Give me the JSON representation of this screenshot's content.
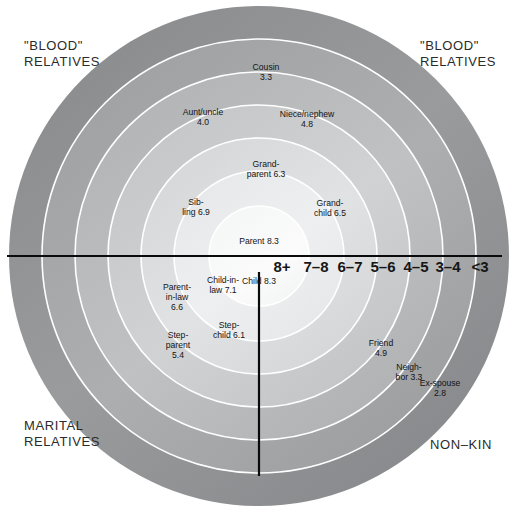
{
  "figure": {
    "type": "concentric-rings",
    "center": {
      "x": 259,
      "y": 256
    },
    "outer_radius": 250
  },
  "quadrant_labels": {
    "top_left": "\"BLOOD\"\nRELATIVES",
    "top_right": "\"BLOOD\"\nRELATIVES",
    "bottom_left": "MARITAL\nRELATIVES",
    "bottom_right": "NON–KIN"
  },
  "scale": {
    "axis_name": "closeness-scale",
    "ticks": [
      {
        "label": "8+",
        "x": 282,
        "y": 266,
        "emphasis": "big"
      },
      {
        "label": "7–8",
        "x": 316,
        "y": 266,
        "emphasis": "big"
      },
      {
        "label": "6–7",
        "x": 350,
        "y": 266,
        "emphasis": "big"
      },
      {
        "label": "5–6",
        "x": 383,
        "y": 266,
        "emphasis": "big"
      },
      {
        "label": "4–5",
        "x": 416,
        "y": 266,
        "emphasis": "big"
      },
      {
        "label": "3–4",
        "x": 448,
        "y": 266,
        "emphasis": "big"
      },
      {
        "label": "<3",
        "x": 480,
        "y": 266,
        "emphasis": "big"
      }
    ]
  },
  "chart_data": {
    "type": "bullseye",
    "title": "",
    "xlabel": "",
    "ylabel": "",
    "value_label": "closeness rating",
    "scale_bands": [
      "8+",
      "7–8",
      "6–7",
      "5–6",
      "4–5",
      "3–4",
      "<3"
    ],
    "categories": [
      "Parent",
      "Child",
      "Child-in-law",
      "Sibling",
      "Parent-in-law",
      "Grandchild",
      "Grandparent",
      "Step-child",
      "Step-parent",
      "Friend",
      "Niece/nephew",
      "Aunt/uncle",
      "Cousin",
      "Neighbor",
      "Ex-spouse"
    ],
    "values": [
      8.3,
      8.3,
      7.1,
      6.9,
      6.6,
      6.5,
      6.3,
      6.1,
      5.4,
      4.9,
      4.8,
      4.0,
      3.3,
      3.3,
      2.8
    ],
    "groups": [
      "\"BLOOD\" RELATIVES",
      "\"BLOOD\" RELATIVES",
      "MARITAL RELATIVES",
      "\"BLOOD\" RELATIVES",
      "MARITAL RELATIVES",
      "\"BLOOD\" RELATIVES",
      "\"BLOOD\" RELATIVES",
      "MARITAL RELATIVES",
      "MARITAL RELATIVES",
      "NON–KIN",
      "\"BLOOD\" RELATIVES",
      "\"BLOOD\" RELATIVES",
      "\"BLOOD\" RELATIVES",
      "NON–KIN",
      "NON–KIN"
    ]
  },
  "nodes": [
    {
      "name": "parent",
      "text": "Parent 8.3",
      "x": 259,
      "y": 241
    },
    {
      "name": "child",
      "text": "Child 8.3",
      "x": 259,
      "y": 281
    },
    {
      "name": "child-in-law",
      "text": "Child-in-\nlaw 7.1",
      "x": 223,
      "y": 285
    },
    {
      "name": "sibling",
      "text": "Sib-\nling 6.9",
      "x": 196,
      "y": 207
    },
    {
      "name": "parent-in-law",
      "text": "Parent-\nin-law\n6.6",
      "x": 177,
      "y": 297
    },
    {
      "name": "grandchild",
      "text": "Grand-\nchild 6.5",
      "x": 330,
      "y": 208
    },
    {
      "name": "grandparent",
      "text": "Grand-\nparent 6.3",
      "x": 266,
      "y": 169
    },
    {
      "name": "step-child",
      "text": "Step-\nchild 6.1",
      "x": 229,
      "y": 330
    },
    {
      "name": "step-parent",
      "text": "Step-\nparent\n5.4",
      "x": 178,
      "y": 345
    },
    {
      "name": "friend",
      "text": "Friend\n4.9",
      "x": 381,
      "y": 348
    },
    {
      "name": "niece-nephew",
      "text": "Niece/nephew\n4.8",
      "x": 307,
      "y": 119
    },
    {
      "name": "aunt-uncle",
      "text": "Aunt/uncle\n4.0",
      "x": 203,
      "y": 117
    },
    {
      "name": "cousin",
      "text": "Cousin\n3.3",
      "x": 266,
      "y": 72
    },
    {
      "name": "neighbor",
      "text": "Neigh-\nbor 3.3",
      "x": 409,
      "y": 372
    },
    {
      "name": "ex-spouse",
      "text": "Ex-spouse\n2.8",
      "x": 440,
      "y": 388
    }
  ],
  "colors": {
    "ring_1_innermost": "#fafafa",
    "ring_2": "#ececec",
    "ring_3": "#dcdcdc",
    "ring_4": "#c9c9c9",
    "ring_5": "#b4b4b4",
    "ring_6": "#a3a3a3",
    "ring_7_outermost": "#8f9193",
    "ring_divider": "#ffffff",
    "axis_line": "#0a0a0a",
    "text": "#161616",
    "background": "#ffffff"
  }
}
